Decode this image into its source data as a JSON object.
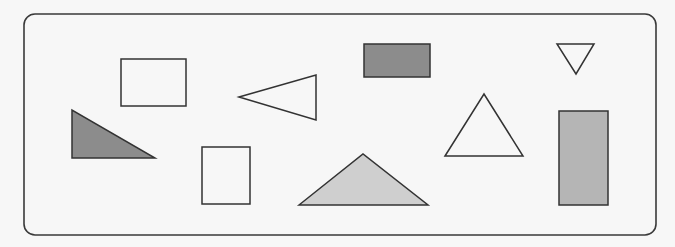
{
  "frame": {
    "x": 24,
    "y": 14,
    "width": 632,
    "height": 221,
    "radius": 11,
    "stroke": "#3a3a3a"
  },
  "colors": {
    "background": "#f7f7f7",
    "stroke": "#333333",
    "unfilled": "none",
    "dark_gray": "#8c8c8c",
    "medium_gray": "#b5b5b5",
    "light_gray": "#cfcfcf"
  },
  "shapes": [
    {
      "id": "rectangle-outline-top-left",
      "type": "rect",
      "x": 121,
      "y": 59,
      "width": 65,
      "height": 47,
      "fill": "none"
    },
    {
      "id": "right-triangle-dark",
      "type": "polygon",
      "points": "72,110 72,158 155,158",
      "fill": "#8c8c8c"
    },
    {
      "id": "triangle-outline-left-pointing",
      "type": "polygon",
      "points": "239,97 316,75 316,120",
      "fill": "none"
    },
    {
      "id": "rectangle-outline-bottom",
      "type": "rect",
      "x": 202,
      "y": 147,
      "width": 48,
      "height": 57,
      "fill": "none"
    },
    {
      "id": "obtuse-triangle-light",
      "type": "polygon",
      "points": "299,205 363,154 428,205",
      "fill": "#cfcfcf"
    },
    {
      "id": "rectangle-dark-top",
      "type": "rect",
      "x": 364,
      "y": 44,
      "width": 66,
      "height": 33,
      "fill": "#8c8c8c"
    },
    {
      "id": "triangle-outline-upright",
      "type": "polygon",
      "points": "445,156 484,94 523,156",
      "fill": "none"
    },
    {
      "id": "triangle-outline-inverted",
      "type": "polygon",
      "points": "557,44 594,44 576,74",
      "fill": "none"
    },
    {
      "id": "rectangle-gray-tall",
      "type": "rect",
      "x": 559,
      "y": 111,
      "width": 49,
      "height": 94,
      "fill": "#b5b5b5"
    }
  ]
}
